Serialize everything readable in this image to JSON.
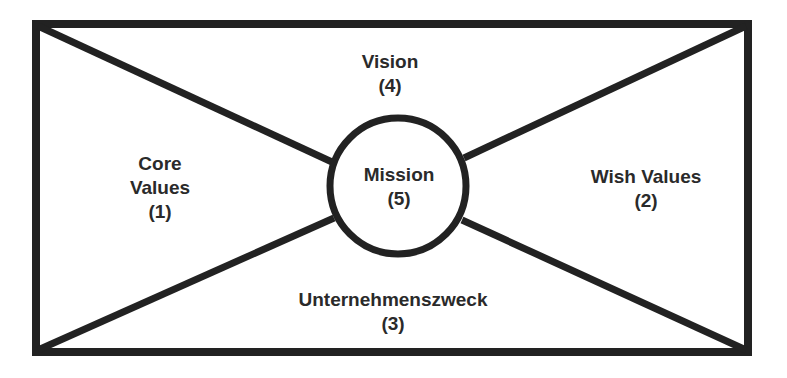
{
  "diagram": {
    "colors": {
      "stroke": "#222222",
      "text": "#2a2a2a",
      "background": "#ffffff"
    },
    "center": {
      "title": "Mission",
      "number": "(5)"
    },
    "sections": [
      {
        "id": "core-values",
        "title": "Core",
        "title2": "Values",
        "number": "(1)"
      },
      {
        "id": "wish-values",
        "title": "Wish Values",
        "number": "(2)"
      },
      {
        "id": "unternehmenszweck",
        "title": "Unternehmenszweck",
        "number": "(3)"
      },
      {
        "id": "vision",
        "title": "Vision",
        "number": "(4)"
      }
    ]
  }
}
